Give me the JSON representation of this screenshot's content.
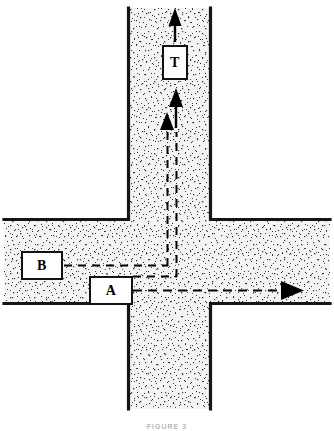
{
  "figure": {
    "type": "road-intersection-diagram",
    "caption": "FIGURE 3",
    "background_color": "#ffffff",
    "line_color": "#1a1a1a",
    "pavement_fill": "#f2f2f2",
    "stipple_color": "#3a3a3a"
  },
  "roads": {
    "vertical": {
      "name": "north-south-road",
      "left_edge_x": 127,
      "right_edge_x": 212,
      "top_y": 8,
      "bottom_y": 409
    },
    "horizontal": {
      "name": "east-west-road",
      "top_edge_y": 218,
      "bottom_edge_y": 305,
      "left_x": 4,
      "right_x": 330
    }
  },
  "vehicles": [
    {
      "id": "T",
      "label": "T",
      "box": {
        "x": 163,
        "y": 46,
        "w": 24,
        "h": 33
      },
      "description": "vehicle T stopped in northbound lane north of intersection",
      "path_direction": "north"
    },
    {
      "id": "B",
      "label": "B",
      "box": {
        "x": 22,
        "y": 252,
        "w": 40,
        "h": 26
      },
      "description": "vehicle B travelling east then turning left to head north",
      "path_direction": "east-then-north"
    },
    {
      "id": "A",
      "label": "A",
      "box": {
        "x": 90,
        "y": 278,
        "w": 40,
        "h": 26
      },
      "description": "vehicle A travelling straight east through intersection",
      "path_direction": "east"
    }
  ],
  "paths": [
    {
      "name": "path-T-solid-arrow",
      "style": "solid",
      "from": [
        175,
        41
      ],
      "to": [
        175,
        12
      ],
      "arrowhead": "up"
    },
    {
      "name": "path-T-approach-solid-arrow",
      "style": "solid",
      "from": [
        175,
        125
      ],
      "to": [
        175,
        88
      ],
      "arrowhead": "up"
    },
    {
      "name": "path-B-dashed-east-segment",
      "style": "dashed",
      "from": [
        64,
        266
      ],
      "to": [
        168,
        266
      ],
      "arrowhead": "none"
    },
    {
      "name": "path-B-dashed-north-segment",
      "style": "dashed",
      "from": [
        168,
        266
      ],
      "to": [
        168,
        115
      ],
      "arrowhead": "up"
    },
    {
      "name": "path-B-dashed-second-turn",
      "style": "dashed",
      "from": [
        130,
        277
      ],
      "to": [
        176,
        277
      ],
      "arrowhead": "none"
    },
    {
      "name": "path-B-dashed-second-north",
      "style": "dashed",
      "from": [
        176,
        277
      ],
      "to": [
        176,
        130
      ],
      "arrowhead": "none"
    },
    {
      "name": "path-A-dashed-east",
      "style": "dashed",
      "from": [
        133,
        291
      ],
      "to": [
        282,
        291
      ],
      "arrowhead": "right"
    }
  ]
}
